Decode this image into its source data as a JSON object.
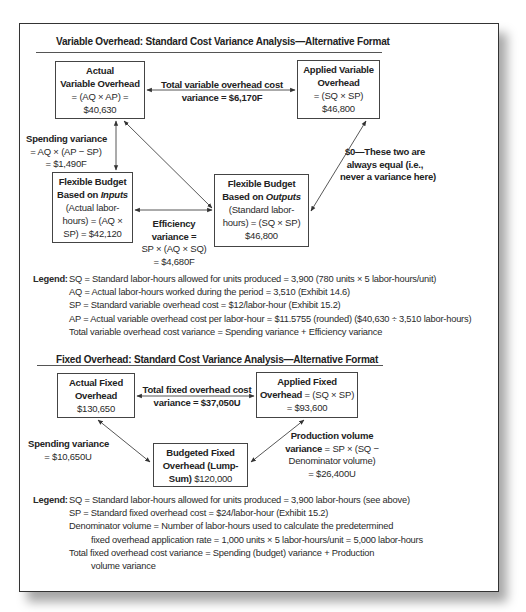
{
  "variable": {
    "title": "Variable Overhead: Standard Cost Variance Analysis—Alternative Format",
    "actual_box": {
      "l1": "Actual",
      "l2": "Variable Overhead",
      "l3": "= (AQ × AP) =",
      "l4": "$40,630"
    },
    "applied_box": {
      "l1": "Applied Variable",
      "l2": "Overhead",
      "l3": "= (SQ × SP)",
      "l4": "$46,800"
    },
    "flex_inputs_box": {
      "l1": "Flexible Budget",
      "l2a": "Based on ",
      "l2b": "Inputs",
      "l3": "(Actual labor-",
      "l4": "hours) = (AQ ×",
      "l5": "SP) = $42,120"
    },
    "flex_outputs_box": {
      "l1": "Flexible Budget",
      "l2a": "Based on ",
      "l2b": "Outputs",
      "l3": "(Standard labor-",
      "l4": "hours) = (SQ × SP)",
      "l5": "$46,800"
    },
    "total_variance": {
      "l1": "Total variable overhead cost",
      "l2a": "variance = ",
      "l2b": "$6,170F"
    },
    "spending_variance": {
      "l1": "Spending variance",
      "l2": "= AQ × (AP − SP)",
      "l3": "= $1,490F"
    },
    "efficiency_variance": {
      "l1": "Efficiency",
      "l2": "variance =",
      "l3": "SP × (AQ × SQ)",
      "l4": "= $4,680F"
    },
    "zero_note": {
      "l1": "$0—These two are",
      "l2": "always equal (i.e.,",
      "l3": "never a variance here)"
    },
    "legend": {
      "key": "Legend:",
      "rows": [
        "SQ = Standard labor-hours allowed for units produced = 3,900 (780 units × 5 labor-hours/unit)",
        "AQ = Actual labor-hours worked during the period = 3,510 (Exhibit 14.6)",
        "SP = Standard variable overhead cost = $12/labor-hour (Exhibit 15.2)",
        "AP = Actual variable overhead cost per labor-hour = $11.5755 (rounded) ($40,630 ÷ 3,510 labor-hours)",
        "Total variable overhead cost variance = Spending variance + Efficiency variance"
      ]
    }
  },
  "fixed": {
    "title": "Fixed Overhead: Standard Cost Variance Analysis—Alternative Format",
    "actual_box": {
      "l1": "Actual Fixed",
      "l2": "Overhead",
      "l3": "$130,650"
    },
    "applied_box": {
      "l1": "Applied Fixed",
      "l2a": "Overhead",
      "l2b": " = (SQ × SP)",
      "l3": "= $93,600"
    },
    "budgeted_box": {
      "l1": "Budgeted Fixed",
      "l2": "Overhead (Lump-",
      "l3a": "Sum)",
      "l3b": " $120,000"
    },
    "total_variance": {
      "l1": "Total fixed overhead cost",
      "l2a": "variance = ",
      "l2b": "$37,050U"
    },
    "spending_variance": {
      "l1": "Spending variance",
      "l2": "= $10,650U"
    },
    "production_volume_variance": {
      "l1": "Production volume",
      "l2a": "variance",
      "l2b": " = SP × (SQ −",
      "l3": "Denominator volume)",
      "l4": "= $26,400U"
    },
    "legend": {
      "key": "Legend:",
      "rows": [
        "SQ = Standard labor-hours allowed for units produced = 3,900 labor-hours (see above)",
        "SP = Standard fixed overhead cost = $24/labor-hour (Exhibit 15.2)",
        "Denominator volume = Number of labor-hours used to calculate the predetermined",
        "fixed overhead application rate = 1,000 units × 5 labor-hours/unit = 5,000 labor-hours",
        "Total fixed overhead cost variance = Spending (budget) variance + Production",
        "volume variance"
      ]
    }
  }
}
